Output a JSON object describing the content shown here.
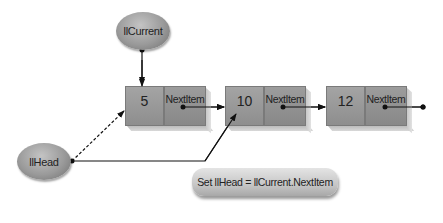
{
  "diagram": {
    "type": "linked-list-pointer-reassignment",
    "pointers": {
      "current": {
        "label": "llCurrent"
      },
      "head": {
        "label": "llHead"
      }
    },
    "nodes": [
      {
        "value": "5",
        "next_label": "NextItem"
      },
      {
        "value": "10",
        "next_label": "NextItem"
      },
      {
        "value": "12",
        "next_label": "NextItem"
      }
    ],
    "statement": "Set llHead = llCurrent.NextItem",
    "colors": {
      "node_fill": "#989898",
      "oval_fill": "#9a9a9a",
      "line": "#111111",
      "background": "#ffffff"
    },
    "edges": [
      {
        "from": "llCurrent",
        "to": "node-0",
        "style": "solid"
      },
      {
        "from": "llHead",
        "to": "node-0",
        "style": "dashed",
        "note": "old link"
      },
      {
        "from": "llHead",
        "to": "node-1",
        "style": "solid",
        "note": "new link"
      },
      {
        "from": "node-0.NextItem",
        "to": "node-1",
        "style": "solid"
      },
      {
        "from": "node-1.NextItem",
        "to": "node-2",
        "style": "solid"
      },
      {
        "from": "node-2.NextItem",
        "to": "end",
        "style": "solid"
      }
    ]
  }
}
